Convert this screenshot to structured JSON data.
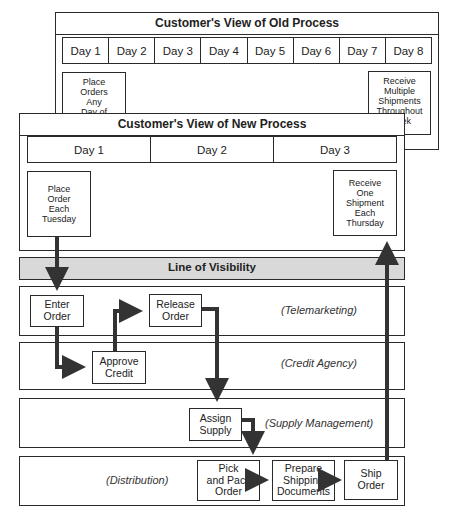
{
  "old_process": {
    "title": "Customer's View of Old Process",
    "days": [
      "Day 1",
      "Day 2",
      "Day 3",
      "Day 4",
      "Day 5",
      "Day 6",
      "Day 7",
      "Day 8"
    ],
    "place_box": {
      "line1": "Place",
      "line2": "Orders",
      "line3": "Any",
      "line4": "Day of"
    },
    "receive_box": {
      "line1": "Receive",
      "line2": "Multiple",
      "line3": "Shipments",
      "line4": "Throughout",
      "line5": "Week"
    }
  },
  "new_process": {
    "title": "Customer's View of New Process",
    "days": [
      "Day 1",
      "Day 2",
      "Day 3"
    ],
    "place_box": {
      "line1": "Place",
      "line2": "Order",
      "line3": "Each",
      "line4": "Tuesday"
    },
    "receive_box": {
      "line1": "Receive",
      "line2": "One",
      "line3": "Shipment",
      "line4": "Each",
      "line5": "Thursday"
    }
  },
  "line_of_visibility": {
    "label": "Line of Visibility",
    "fill": "#d9d9d9"
  },
  "lanes": [
    {
      "label": "(Telemarketing)"
    },
    {
      "label": "(Credit Agency)"
    },
    {
      "label": "(Supply Management)"
    },
    {
      "label": "(Distribution)"
    }
  ],
  "steps": {
    "enter_order": {
      "line1": "Enter",
      "line2": "Order"
    },
    "release_order": {
      "line1": "Release",
      "line2": "Order"
    },
    "approve_credit": {
      "line1": "Approve",
      "line2": "Credit"
    },
    "assign_supply": {
      "line1": "Assign",
      "line2": "Supply"
    },
    "pick_pack": {
      "line1": "Pick",
      "line2": "and Pack",
      "line3": "Order"
    },
    "prepare_docs": {
      "line1": "Prepare",
      "line2": "Shipping",
      "line3": "Documents"
    },
    "ship_order": {
      "line1": "Ship",
      "line2": "Order"
    }
  },
  "colors": {
    "stroke": "#2a2a2a",
    "arrow": "#333333"
  }
}
